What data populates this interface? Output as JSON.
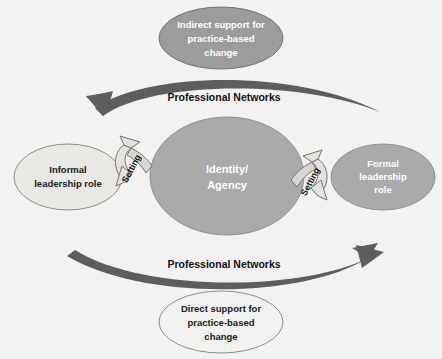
{
  "diagram": {
    "background_color": "#f3f2f0",
    "nodes": {
      "top_ellipse": {
        "name": "indirect-support",
        "lines": [
          "Indirect support for",
          "practice-based",
          "change"
        ],
        "fill": "#9a9a9a",
        "stroke": "#6e6e6e",
        "text_color": "#ffffff",
        "cx": 221,
        "cy": 38,
        "rx": 62,
        "ry": 31
      },
      "bottom_ellipse": {
        "name": "direct-support",
        "lines": [
          "Direct support for",
          "practice-based",
          "change"
        ],
        "fill": "#f4f4f2",
        "stroke": "#8a8a8a",
        "text_color": "#1a1a1a",
        "cx": 221,
        "cy": 322,
        "rx": 62,
        "ry": 31
      },
      "center_ellipse": {
        "name": "identity-agency",
        "lines": [
          "Identity/",
          "Agency"
        ],
        "fill": "#a9a9a9",
        "stroke": "#8d8d8d",
        "text_color": "#ffffff",
        "cx": 227,
        "cy": 176,
        "rx": 77,
        "ry": 59
      },
      "left_ellipse": {
        "name": "informal-leadership-role",
        "lines": [
          "Informal",
          "leadership role"
        ],
        "fill": "#eceae6",
        "stroke": "#8a8a8a",
        "text_color": "#1a1a1a",
        "cx": 68,
        "cy": 177,
        "rx": 54,
        "ry": 33
      },
      "right_ellipse": {
        "name": "formal-leadership-role",
        "lines": [
          "Formal",
          "leadership",
          "role"
        ],
        "fill": "#a9a9a9",
        "stroke": "#8d8d8d",
        "text_color": "#ffffff",
        "cx": 383,
        "cy": 177,
        "rx": 52,
        "ry": 33
      }
    },
    "flows": [
      {
        "name": "professional-networks-top",
        "label": "Professional Networks",
        "direction": "left",
        "color": "#555555",
        "label_x": 224,
        "label_y": 101
      },
      {
        "name": "professional-networks-bottom",
        "label": "Professional Networks",
        "direction": "right",
        "color": "#555555",
        "label_x": 224,
        "label_y": 268
      }
    ],
    "setting_arrows": [
      {
        "name": "setting-left",
        "label": "Setting",
        "label_x": 134,
        "label_y": 170,
        "rotation": -62,
        "fill": "#e6e4e0",
        "stroke": "#6f6f6f"
      },
      {
        "name": "setting-right",
        "label": "Setting",
        "label_x": 313,
        "label_y": 183,
        "rotation": -62,
        "fill": "#e6e4e0",
        "stroke": "#6f6f6f"
      }
    ]
  }
}
